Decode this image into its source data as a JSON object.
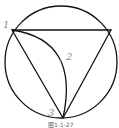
{
  "diagram": {
    "caption": "图1-1-27",
    "stroke_color": "#111111",
    "label_color": "#8a8a8a",
    "points": [
      {
        "label": "1",
        "x": 12,
        "y": 30
      },
      {
        "label": "2",
        "x": 62,
        "y": 61
      },
      {
        "label": "3",
        "x": 63,
        "y": 118
      }
    ],
    "circle": {
      "cx": 61,
      "cy": 62,
      "r": 56
    },
    "triangle": [
      [
        12,
        30
      ],
      [
        111,
        30
      ],
      [
        63,
        118
      ]
    ]
  }
}
